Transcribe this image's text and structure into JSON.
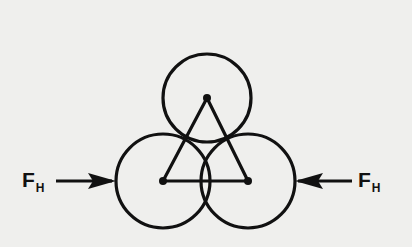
{
  "diagram": {
    "forces": {
      "left": {
        "symbol": "F",
        "subscript": "H",
        "direction": "right"
      },
      "right": {
        "symbol": "F",
        "subscript": "H",
        "direction": "left"
      }
    },
    "circles": [
      {
        "name": "top",
        "cx": 207,
        "cy": 98,
        "r": 44
      },
      {
        "name": "bottom-left",
        "cx": 163,
        "cy": 181,
        "r": 47
      },
      {
        "name": "bottom-right",
        "cx": 248,
        "cy": 181,
        "r": 47
      }
    ],
    "colors": {
      "ink": "#111111",
      "paper": "#efefed"
    }
  }
}
